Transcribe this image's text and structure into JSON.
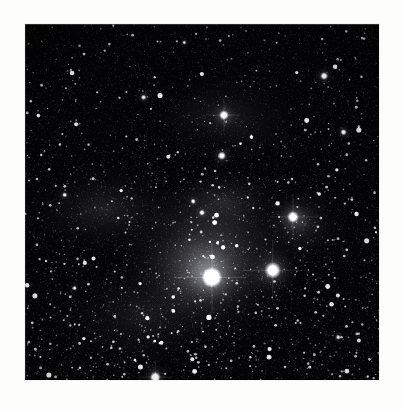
{
  "page": {
    "background_color": "#fdfdfc",
    "width": 404,
    "height": 411
  },
  "image": {
    "label": "astronomical-starfield-photograph",
    "kind": "grayscale astrophotograph",
    "subject": "dense star field with bright stars, diffuse reflection nebulosity and dark dust lanes",
    "frame": {
      "x": 25,
      "y": 24,
      "width": 354,
      "height": 356
    },
    "background_color": "#050506",
    "border_color": "#e8e8e8",
    "colors": {
      "sky_darkest": "#040406",
      "sky_dark": "#0b0b0d",
      "nebula_mid": "#54565a",
      "nebula_bright": "#8d9095",
      "star_core": "#ffffff"
    },
    "noise": {
      "star_count": 5200,
      "grain_count": 14000,
      "grain_opacity": 0.3
    },
    "nebula_clouds": [
      {
        "name": "central-bright-glow",
        "cx": 0.52,
        "cy": 0.66,
        "rx": 0.3,
        "ry": 0.26,
        "intensity": 0.46
      },
      {
        "name": "central-core-glow",
        "cx": 0.5,
        "cy": 0.7,
        "rx": 0.17,
        "ry": 0.15,
        "intensity": 0.4
      },
      {
        "name": "upper-veil",
        "cx": 0.58,
        "cy": 0.27,
        "rx": 0.26,
        "ry": 0.17,
        "intensity": 0.22
      },
      {
        "name": "left-band",
        "cx": 0.22,
        "cy": 0.52,
        "rx": 0.26,
        "ry": 0.14,
        "intensity": 0.2
      },
      {
        "name": "right-knot",
        "cx": 0.78,
        "cy": 0.56,
        "rx": 0.13,
        "ry": 0.12,
        "intensity": 0.26
      },
      {
        "name": "lower-left-haze",
        "cx": 0.33,
        "cy": 0.82,
        "rx": 0.28,
        "ry": 0.18,
        "intensity": 0.16
      },
      {
        "name": "mid-bridge",
        "cx": 0.56,
        "cy": 0.5,
        "rx": 0.2,
        "ry": 0.13,
        "intensity": 0.2
      }
    ],
    "dark_lanes": [
      {
        "name": "upper-dust-lane",
        "cx": 0.52,
        "cy": 0.36,
        "rx": 0.27,
        "ry": 0.11,
        "rot": -12,
        "strength": 0.62
      },
      {
        "name": "upper-right-dust",
        "cx": 0.7,
        "cy": 0.23,
        "rx": 0.17,
        "ry": 0.1,
        "rot": 14,
        "strength": 0.5
      },
      {
        "name": "top-dark-field",
        "cx": 0.4,
        "cy": 0.1,
        "rx": 0.4,
        "ry": 0.14,
        "rot": 0,
        "strength": 0.7
      },
      {
        "name": "left-dark-edge",
        "cx": 0.06,
        "cy": 0.3,
        "rx": 0.16,
        "ry": 0.3,
        "rot": 0,
        "strength": 0.55
      },
      {
        "name": "right-dark-edge",
        "cx": 0.95,
        "cy": 0.3,
        "rx": 0.16,
        "ry": 0.34,
        "rot": 0,
        "strength": 0.55
      },
      {
        "name": "notch-dust",
        "cx": 0.46,
        "cy": 0.42,
        "rx": 0.1,
        "ry": 0.05,
        "rot": -20,
        "strength": 0.55
      }
    ],
    "bright_stars": [
      {
        "name": "primary-star-lower-left",
        "x": 0.528,
        "y": 0.712,
        "radius": 10.5,
        "glow": 30,
        "brightness": 1.0
      },
      {
        "name": "secondary-star-lower-right",
        "x": 0.7,
        "y": 0.692,
        "radius": 8.5,
        "glow": 26,
        "brightness": 0.95
      },
      {
        "name": "star-right-nebula",
        "x": 0.757,
        "y": 0.542,
        "radius": 6.0,
        "glow": 20,
        "brightness": 0.88
      },
      {
        "name": "star-upper-center",
        "x": 0.562,
        "y": 0.256,
        "radius": 5.0,
        "glow": 14,
        "brightness": 0.85
      },
      {
        "name": "star-mid-right",
        "x": 0.556,
        "y": 0.37,
        "radius": 4.2,
        "glow": 12,
        "brightness": 0.8
      },
      {
        "name": "star-bottom-edge",
        "x": 0.368,
        "y": 0.992,
        "radius": 5.5,
        "glow": 15,
        "brightness": 0.9
      },
      {
        "name": "star-upper-right-corner",
        "x": 0.845,
        "y": 0.146,
        "radius": 4.0,
        "glow": 11,
        "brightness": 0.82
      },
      {
        "name": "star-right-high",
        "x": 0.9,
        "y": 0.304,
        "radius": 3.2,
        "glow": 9,
        "brightness": 0.75
      },
      {
        "name": "star-mid-center",
        "x": 0.5,
        "y": 0.53,
        "radius": 3.0,
        "glow": 8,
        "brightness": 0.72
      },
      {
        "name": "star-center-pair-a",
        "x": 0.475,
        "y": 0.498,
        "radius": 2.6,
        "glow": 7,
        "brightness": 0.7
      },
      {
        "name": "star-left-mid",
        "x": 0.112,
        "y": 0.48,
        "radius": 2.6,
        "glow": 7,
        "brightness": 0.68
      },
      {
        "name": "star-upper-left-faint",
        "x": 0.335,
        "y": 0.206,
        "radius": 2.8,
        "glow": 8,
        "brightness": 0.7
      },
      {
        "name": "star-lower-right-far",
        "x": 0.885,
        "y": 0.88,
        "radius": 2.6,
        "glow": 7,
        "brightness": 0.66
      },
      {
        "name": "star-low-left",
        "x": 0.14,
        "y": 0.742,
        "radius": 2.4,
        "glow": 6,
        "brightness": 0.64
      },
      {
        "name": "star-top-mid",
        "x": 0.45,
        "y": 0.052,
        "radius": 2.2,
        "glow": 6,
        "brightness": 0.62
      }
    ]
  }
}
